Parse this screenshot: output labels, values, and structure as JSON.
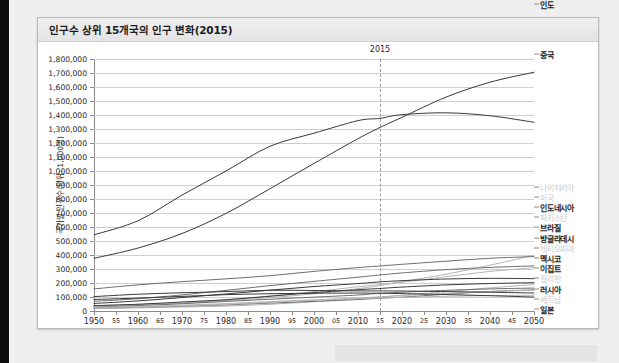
{
  "chart_title": "인구수 상위 15개국의 인구 변화(2015)",
  "annotation": {
    "year_marker_label": "2015",
    "year_marker_value": 2015
  },
  "axis": {
    "y_title": "국가별 인구수(단위: 1,000명)",
    "y_ticks": [
      "0",
      "100,000",
      "200,000",
      "300,000",
      "400,000",
      "500,000",
      "600,000",
      "700,000",
      "800,000",
      "900,000",
      "1,000,000",
      "1,100,000",
      "1,200,000",
      "1,300,000",
      "1,400,000",
      "1,500,000",
      "1,600,000",
      "1,700,000",
      "1,800,000"
    ],
    "x_ticks": [
      "1950",
      "55",
      "1960",
      "65",
      "1970",
      "75",
      "1980",
      "85",
      "1990",
      "95",
      "2000",
      "05",
      "2010",
      "15",
      "2020",
      "25",
      "2030",
      "35",
      "2040",
      "45",
      "2050"
    ]
  },
  "legend": {
    "items": [
      {
        "label": "인도",
        "faded": false
      },
      {
        "label": "중국",
        "faded": false
      },
      {
        "label": "나이지리아",
        "faded": true
      },
      {
        "label": "미국",
        "faded": true
      },
      {
        "label": "인도네시아",
        "faded": false
      },
      {
        "label": "파키스탄",
        "faded": true
      },
      {
        "label": "브라질",
        "faded": false
      },
      {
        "label": "방글라데시",
        "faded": false
      },
      {
        "label": "에티오피아",
        "faded": true
      },
      {
        "label": "멕시코",
        "faded": false
      },
      {
        "label": "이집트",
        "faded": false
      },
      {
        "label": "필리핀",
        "faded": true
      },
      {
        "label": "러시아",
        "faded": false
      },
      {
        "label": "베트남",
        "faded": true
      },
      {
        "label": "일본",
        "faded": false
      }
    ]
  },
  "colors": {
    "line_dark": "#3a3a3a",
    "line_mid": "#6e6e6e",
    "line_light": "#b4b4b4",
    "grid": "#cfcfcf",
    "axis": "#8c8c8c",
    "panel_bg": "#ffffff",
    "page_bg": "#efefef"
  },
  "chart_data": {
    "type": "line",
    "title": "인구수 상위 15개국의 인구 변화(2015)",
    "xlabel": "",
    "ylabel": "국가별 인구수(단위: 1,000명)",
    "xlim": [
      1950,
      2050
    ],
    "ylim": [
      0,
      1800000
    ],
    "grid": true,
    "legend_position": "right",
    "x": [
      1950,
      1960,
      1970,
      1980,
      1990,
      2000,
      2010,
      2015,
      2020,
      2030,
      2040,
      2050
    ],
    "series": [
      {
        "name": "인도",
        "color": "#3a3a3a",
        "values": [
          376325,
          449662,
          553579,
          696783,
          873785,
          1053898,
          1230985,
          1311051,
          1383198,
          1527658,
          1634150,
          1705333
        ]
      },
      {
        "name": "중국",
        "color": "#3a3a3a",
        "values": [
          544114,
          644450,
          827601,
          1000089,
          1176884,
          1269974,
          1359821,
          1376049,
          1402385,
          1415546,
          1394538,
          1348056
        ]
      },
      {
        "name": "나이지리아",
        "color": "#b4b4b4",
        "values": [
          37860,
          45138,
          55982,
          73424,
          95617,
          122877,
          159425,
          182202,
          210344,
          262599,
          327173,
          398508
        ]
      },
      {
        "name": "미국",
        "color": "#6e6e6e",
        "values": [
          157813,
          186721,
          209513,
          229588,
          252120,
          282896,
          309876,
          321774,
          333546,
          355760,
          376517,
          388865
        ]
      },
      {
        "name": "인도네시아",
        "color": "#6e6e6e",
        "values": [
          69543,
          87751,
          114835,
          147490,
          181413,
          211540,
          241613,
          257564,
          271857,
          295482,
          311336,
          322237
        ]
      },
      {
        "name": "파키스탄",
        "color": "#b4b4b4",
        "values": [
          37542,
          44989,
          58133,
          78074,
          107648,
          138253,
          173149,
          188925,
          204920,
          244924,
          282739,
          309640
        ]
      },
      {
        "name": "브라질",
        "color": "#3a3a3a",
        "values": [
          53975,
          72179,
          95989,
          121672,
          149003,
          174790,
          195713,
          207848,
          216410,
          228663,
          233261,
          231120
        ]
      },
      {
        "name": "방글라데시",
        "color": "#3a3a3a",
        "values": [
          37895,
          48200,
          64232,
          80624,
          105256,
          131581,
          152149,
          160996,
          170937,
          186460,
          196298,
          202209
        ]
      },
      {
        "name": "에티오피아",
        "color": "#b4b4b4",
        "values": [
          18128,
          22152,
          28415,
          35142,
          48057,
          66444,
          87562,
          99391,
          112759,
          138297,
          165636,
          188455
        ]
      },
      {
        "name": "멕시코",
        "color": "#6e6e6e",
        "values": [
          28296,
          38676,
          51493,
          68347,
          83943,
          98900,
          114093,
          127017,
          133871,
          148132,
          157904,
          163754
        ]
      },
      {
        "name": "이집트",
        "color": "#6e6e6e",
        "values": [
          20876,
          26631,
          34782,
          43749,
          56843,
          68335,
          82041,
          91508,
          98887,
          119747,
          139520,
          151111
        ]
      },
      {
        "name": "필리핀",
        "color": "#b4b4b4",
        "values": [
          18580,
          25335,
          35805,
          47358,
          61629,
          77652,
          93445,
          100699,
          109703,
          125372,
          139172,
          148260
        ]
      },
      {
        "name": "러시아",
        "color": "#3a3a3a",
        "values": [
          102799,
          119906,
          130245,
          138658,
          147974,
          146597,
          143479,
          143457,
          142569,
          138658,
          134000,
          128599
        ]
      },
      {
        "name": "베트남",
        "color": "#b4b4b4",
        "values": [
          27367,
          32671,
          41929,
          53005,
          67102,
          79910,
          87968,
          93448,
          97431,
          105221,
          110164,
          112783
        ]
      },
      {
        "name": "일본",
        "color": "#3a3a3a",
        "values": [
          82199,
          92501,
          104345,
          116807,
          123537,
          126843,
          128057,
          126573,
          124100,
          117515,
          109276,
          99424
        ]
      }
    ]
  }
}
